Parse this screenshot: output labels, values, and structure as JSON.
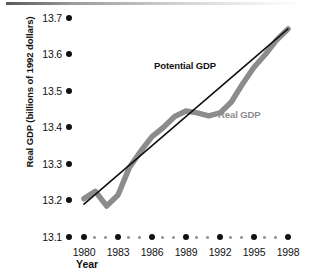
{
  "chart_data": {
    "type": "line",
    "title": "",
    "xlabel": "Year",
    "ylabel": "Real GDP (billions of 1992 dollars)",
    "xlim": [
      1979,
      1999
    ],
    "ylim": [
      13.1,
      13.7
    ],
    "grid": false,
    "legend_position": "inline-annotations",
    "y_ticks": [
      "13.7",
      "13.6",
      "13.5",
      "13.4",
      "13.3",
      "13.2",
      "13.1"
    ],
    "y_tick_values": [
      13.7,
      13.6,
      13.5,
      13.4,
      13.3,
      13.2,
      13.1
    ],
    "x_ticks": [
      "1980",
      "1983",
      "1986",
      "1989",
      "1992",
      "1995",
      "1998"
    ],
    "x_tick_values": [
      1980,
      1983,
      1986,
      1989,
      1992,
      1995,
      1998
    ],
    "x_minor_ticks": [
      1981,
      1982,
      1984,
      1985,
      1987,
      1988,
      1990,
      1991,
      1993,
      1994,
      1996,
      1997
    ],
    "series": [
      {
        "name": "Potential GDP",
        "color": "#111111",
        "style": "straight-thin",
        "x": [
          1980,
          1998
        ],
        "values": [
          13.19,
          13.67
        ]
      },
      {
        "name": "Real GDP",
        "color": "#8c8c8c",
        "style": "thick-wavy",
        "x": [
          1980,
          1981,
          1982,
          1983,
          1984,
          1985,
          1986,
          1987,
          1988,
          1989,
          1990,
          1991,
          1992,
          1993,
          1994,
          1995,
          1996,
          1997,
          1998
        ],
        "values": [
          13.205,
          13.225,
          13.185,
          13.215,
          13.29,
          13.335,
          13.375,
          13.4,
          13.43,
          13.445,
          13.44,
          13.432,
          13.44,
          13.47,
          13.52,
          13.565,
          13.6,
          13.64,
          13.67
        ]
      }
    ],
    "annotations": [
      {
        "text": "Potential GDP",
        "color": "#111111"
      },
      {
        "text": "Real GDP",
        "color": "#8c8c8c"
      }
    ]
  },
  "axes": {
    "y_title": "Real GDP (billions of 1992 dollars)",
    "x_title": "Year"
  }
}
